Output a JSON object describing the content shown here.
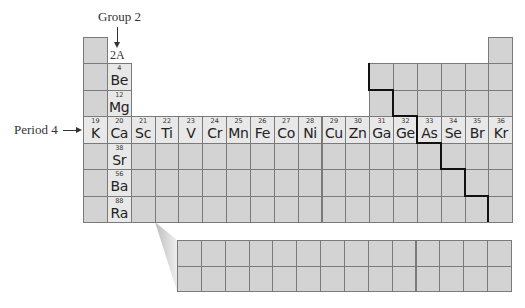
{
  "labels": {
    "group": "Group 2",
    "group_code": "2A",
    "period": "Period 4"
  },
  "group2_elements": [
    {
      "number": "4",
      "symbol": "Be"
    },
    {
      "number": "12",
      "symbol": "Mg"
    },
    {
      "number": "20",
      "symbol": "Ca"
    },
    {
      "number": "38",
      "symbol": "Sr"
    },
    {
      "number": "56",
      "symbol": "Ba"
    },
    {
      "number": "88",
      "symbol": "Ra"
    }
  ],
  "period4_elements": [
    {
      "number": "19",
      "symbol": "K"
    },
    {
      "number": "20",
      "symbol": "Ca"
    },
    {
      "number": "21",
      "symbol": "Sc"
    },
    {
      "number": "22",
      "symbol": "Ti"
    },
    {
      "number": "23",
      "symbol": "V"
    },
    {
      "number": "24",
      "symbol": "Cr"
    },
    {
      "number": "25",
      "symbol": "Mn"
    },
    {
      "number": "26",
      "symbol": "Fe"
    },
    {
      "number": "27",
      "symbol": "Co"
    },
    {
      "number": "28",
      "symbol": "Ni"
    },
    {
      "number": "29",
      "symbol": "Cu"
    },
    {
      "number": "30",
      "symbol": "Zn"
    },
    {
      "number": "31",
      "symbol": "Ga"
    },
    {
      "number": "32",
      "symbol": "Ge"
    },
    {
      "number": "33",
      "symbol": "As"
    },
    {
      "number": "34",
      "symbol": "Se"
    },
    {
      "number": "35",
      "symbol": "Br"
    },
    {
      "number": "36",
      "symbol": "Kr"
    }
  ],
  "colors": {
    "cell": "#d3d3d3",
    "highlight": "#e8e8e8",
    "border": "#7a7a7a",
    "metal_line": "#111111"
  }
}
